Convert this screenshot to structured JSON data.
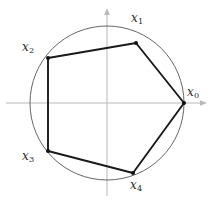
{
  "figure": {
    "background": "#ffffff",
    "width": 213,
    "height": 201
  },
  "colors": {
    "axis": "#b9b9b9",
    "circle": "#555555",
    "polygon": "#1a1a1a",
    "vertex": "#111111",
    "label": "#2b2b2b"
  },
  "axes": {
    "x_axis_name": "horizontal-axis",
    "y_axis_name": "vertical-axis",
    "origin_x": 107,
    "origin_y": 103,
    "x_arrow_tip_x": 207,
    "y_arrow_tip_y": 8,
    "stroke_width": 1
  },
  "circle": {
    "center_x": 107,
    "center_y": 103,
    "radius": 77,
    "stroke_width": 0.9
  },
  "polygon": {
    "stroke_width": 1.9,
    "vertex_radius": 2.0,
    "closed": true
  },
  "chart_data": {
    "type": "scatter",
    "xlabel": "",
    "ylabel": "",
    "grid": false,
    "legend": null,
    "points": [
      {
        "label": "x",
        "sub": "0",
        "px": 184,
        "py": 103,
        "label_x": 187,
        "label_y": 86
      },
      {
        "label": "x",
        "sub": "1",
        "px": 136,
        "py": 43,
        "label_x": 131,
        "label_y": 12
      },
      {
        "label": "x",
        "sub": "2",
        "px": 48,
        "py": 58,
        "label_x": 22,
        "label_y": 41
      },
      {
        "label": "x",
        "sub": "3",
        "px": 48,
        "py": 151,
        "label_x": 22,
        "label_y": 150
      },
      {
        "label": "x",
        "sub": "4",
        "px": 133,
        "py": 173,
        "label_x": 130,
        "label_y": 179
      }
    ],
    "edges": [
      [
        0,
        1
      ],
      [
        1,
        2
      ],
      [
        2,
        3
      ],
      [
        3,
        4
      ],
      [
        4,
        0
      ]
    ]
  }
}
